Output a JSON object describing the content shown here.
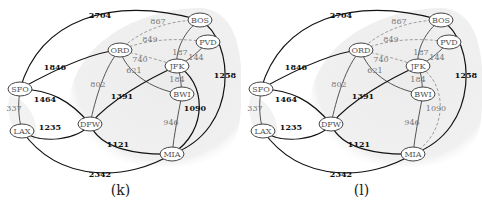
{
  "panels": [
    {
      "caption": "(k)",
      "nodes": {
        "BOS": {
          "label": "BOS",
          "x": 200,
          "y": 20
        },
        "PVD": {
          "label": "PVD",
          "x": 208,
          "y": 42
        },
        "ORD": {
          "label": "ORD",
          "x": 120,
          "y": 50
        },
        "JFK": {
          "label": "JFK",
          "x": 177,
          "y": 66
        },
        "BWI": {
          "label": "BWI",
          "x": 182,
          "y": 94
        },
        "SFO": {
          "label": "SFO",
          "x": 20,
          "y": 89
        },
        "LAX": {
          "label": "LAX",
          "x": 22,
          "y": 131
        },
        "DFW": {
          "label": "DFW",
          "x": 90,
          "y": 124
        },
        "MIA": {
          "label": "MIA",
          "x": 172,
          "y": 154
        }
      },
      "edges": [
        {
          "from": "SFO",
          "to": "BOS",
          "weight": "2704",
          "style": "bold"
        },
        {
          "from": "ORD",
          "to": "BOS",
          "weight": "867",
          "style": "dashed"
        },
        {
          "from": "ORD",
          "to": "PVD",
          "weight": "849",
          "style": "dashed"
        },
        {
          "from": "ORD",
          "to": "JFK",
          "weight": "740",
          "style": "dashed"
        },
        {
          "from": "JFK",
          "to": "BOS",
          "weight": "187",
          "style": "light"
        },
        {
          "from": "JFK",
          "to": "PVD",
          "weight": "144",
          "style": "light"
        },
        {
          "from": "SFO",
          "to": "ORD",
          "weight": "1846",
          "style": "bold"
        },
        {
          "from": "ORD",
          "to": "BWI",
          "weight": "621",
          "style": "light"
        },
        {
          "from": "ORD",
          "to": "DFW",
          "weight": "802",
          "style": "light"
        },
        {
          "from": "JFK",
          "to": "BWI",
          "weight": "184",
          "style": "light"
        },
        {
          "from": "BOS",
          "to": "MIA",
          "weight": "1258",
          "style": "bold"
        },
        {
          "from": "DFW",
          "to": "JFK",
          "weight": "1391",
          "style": "bold"
        },
        {
          "from": "JFK",
          "to": "MIA",
          "weight": "1090",
          "style": "bold"
        },
        {
          "from": "BWI",
          "to": "MIA",
          "weight": "946",
          "style": "light"
        },
        {
          "from": "SFO",
          "to": "DFW",
          "weight": "1464",
          "style": "bold"
        },
        {
          "from": "SFO",
          "to": "LAX",
          "weight": "337",
          "style": "light"
        },
        {
          "from": "LAX",
          "to": "DFW",
          "weight": "1235",
          "style": "bold"
        },
        {
          "from": "DFW",
          "to": "MIA",
          "weight": "1121",
          "style": "bold"
        },
        {
          "from": "LAX",
          "to": "MIA",
          "weight": "2342",
          "style": "bold"
        }
      ]
    },
    {
      "caption": "(l)",
      "nodes": {
        "BOS": {
          "label": "BOS",
          "x": 200,
          "y": 20
        },
        "PVD": {
          "label": "PVD",
          "x": 208,
          "y": 42
        },
        "ORD": {
          "label": "ORD",
          "x": 120,
          "y": 50
        },
        "JFK": {
          "label": "JFK",
          "x": 177,
          "y": 66
        },
        "BWI": {
          "label": "BWI",
          "x": 182,
          "y": 94
        },
        "SFO": {
          "label": "SFO",
          "x": 20,
          "y": 89
        },
        "LAX": {
          "label": "LAX",
          "x": 22,
          "y": 131
        },
        "DFW": {
          "label": "DFW",
          "x": 90,
          "y": 124
        },
        "MIA": {
          "label": "MIA",
          "x": 172,
          "y": 154
        }
      },
      "edges": [
        {
          "from": "SFO",
          "to": "BOS",
          "weight": "2704",
          "style": "bold"
        },
        {
          "from": "ORD",
          "to": "BOS",
          "weight": "867",
          "style": "dashed"
        },
        {
          "from": "ORD",
          "to": "PVD",
          "weight": "849",
          "style": "dashed"
        },
        {
          "from": "ORD",
          "to": "JFK",
          "weight": "740",
          "style": "dashed"
        },
        {
          "from": "JFK",
          "to": "BOS",
          "weight": "187",
          "style": "light"
        },
        {
          "from": "JFK",
          "to": "PVD",
          "weight": "144",
          "style": "light"
        },
        {
          "from": "SFO",
          "to": "ORD",
          "weight": "1846",
          "style": "bold"
        },
        {
          "from": "ORD",
          "to": "BWI",
          "weight": "621",
          "style": "light"
        },
        {
          "from": "ORD",
          "to": "DFW",
          "weight": "802",
          "style": "light"
        },
        {
          "from": "JFK",
          "to": "BWI",
          "weight": "184",
          "style": "light"
        },
        {
          "from": "BOS",
          "to": "MIA",
          "weight": "1258",
          "style": "bold"
        },
        {
          "from": "DFW",
          "to": "JFK",
          "weight": "1391",
          "style": "bold"
        },
        {
          "from": "JFK",
          "to": "MIA",
          "weight": "1090",
          "style": "dashed"
        },
        {
          "from": "BWI",
          "to": "MIA",
          "weight": "946",
          "style": "light"
        },
        {
          "from": "SFO",
          "to": "DFW",
          "weight": "1464",
          "style": "bold"
        },
        {
          "from": "SFO",
          "to": "LAX",
          "weight": "337",
          "style": "light"
        },
        {
          "from": "LAX",
          "to": "DFW",
          "weight": "1235",
          "style": "bold"
        },
        {
          "from": "DFW",
          "to": "MIA",
          "weight": "1121",
          "style": "bold"
        },
        {
          "from": "LAX",
          "to": "MIA",
          "weight": "2342",
          "style": "bold"
        }
      ]
    }
  ],
  "colors": {
    "cloud": "#ececec",
    "bold_edge": "#111111",
    "light_edge": "#444444",
    "dashed_edge": "#888888",
    "node_stroke": "#444444",
    "node_fill": "#ffffff"
  }
}
